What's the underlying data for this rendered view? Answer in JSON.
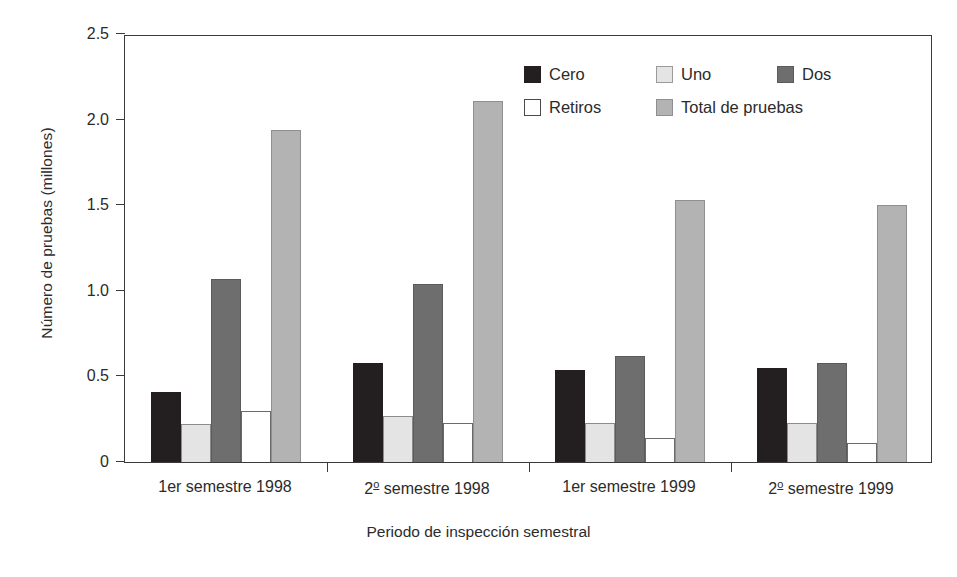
{
  "chart_data": {
    "type": "bar",
    "title": "",
    "xlabel": "Periodo de inspección semestral",
    "ylabel": "Número de pruebas (millones)",
    "categories": [
      "1er semestre 1998",
      "2º semestre 1998",
      "1er semestre 1999",
      "2º semestre 1999"
    ],
    "series": [
      {
        "name": "Cero",
        "color": "#231f20",
        "values": [
          0.41,
          0.58,
          0.54,
          0.55
        ]
      },
      {
        "name": "Uno",
        "color": "#e4e4e4",
        "values": [
          0.22,
          0.27,
          0.23,
          0.23
        ]
      },
      {
        "name": "Dos",
        "color": "#6e6e6e",
        "values": [
          1.07,
          1.04,
          0.62,
          0.58
        ]
      },
      {
        "name": "Retiros",
        "color": "#ffffff",
        "values": [
          0.3,
          0.23,
          0.14,
          0.11
        ]
      },
      {
        "name": "Total de pruebas",
        "color": "#b3b3b3",
        "values": [
          1.94,
          2.11,
          1.53,
          1.5
        ]
      }
    ],
    "ylim": [
      0,
      2.5
    ],
    "yticks": [
      0,
      0.5,
      1.0,
      1.5,
      2.0,
      2.5
    ],
    "ytick_labels": [
      "0",
      "0.5",
      "1.0",
      "1.5",
      "2.0",
      "2.5"
    ],
    "grid": false,
    "legend_position": "top-right"
  },
  "xtick_labels": [
    {
      "prefix": "1er semestre 1998",
      "sup": "",
      "suffix": ""
    },
    {
      "prefix": "2",
      "sup": "o",
      "suffix": " semestre 1998"
    },
    {
      "prefix": "1er semestre 1999",
      "sup": "",
      "suffix": ""
    },
    {
      "prefix": "2",
      "sup": "o",
      "suffix": " semestre 1999"
    }
  ]
}
